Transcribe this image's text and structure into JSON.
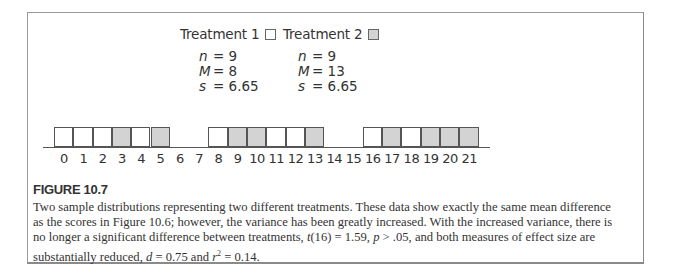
{
  "chart_data": {
    "type": "bar",
    "subtype": "frequency-distribution-blocks",
    "title": "FIGURE 10.7",
    "xlabel": "",
    "ylabel": "",
    "x_ticks": [
      0,
      1,
      2,
      3,
      4,
      5,
      6,
      7,
      8,
      9,
      10,
      11,
      12,
      13,
      14,
      15,
      16,
      17,
      18,
      19,
      20,
      21
    ],
    "xlim": [
      0,
      21
    ],
    "grid": false,
    "legend": [
      {
        "name": "Treatment 1",
        "fill": "#ffffff"
      },
      {
        "name": "Treatment 2",
        "fill": "#d3d3d3"
      }
    ],
    "series": [
      {
        "name": "Treatment 1",
        "fill": "#ffffff",
        "scores": [
          0,
          1,
          2,
          4,
          8,
          11,
          12,
          16,
          18
        ],
        "n": 9,
        "M": 8,
        "s": 6.65
      },
      {
        "name": "Treatment 2",
        "fill": "#d3d3d3",
        "scores": [
          3,
          5,
          9,
          10,
          13,
          17,
          19,
          20,
          21
        ],
        "n": 9,
        "M": 13,
        "s": 6.65
      }
    ]
  },
  "legend": {
    "t1": {
      "label": "Treatment 1",
      "stats": {
        "n": "= 9",
        "M": "= 8",
        "s": "= 6.65"
      }
    },
    "t2": {
      "label": "Treatment 2",
      "stats": {
        "n": "= 9",
        "M": "= 13",
        "s": "= 6.65"
      }
    },
    "sym_n": "n",
    "sym_M": "M",
    "sym_s": "s"
  },
  "figure": {
    "title": "FIGURE 10.7",
    "caption_parts": {
      "p1": "Two sample distributions representing two different treatments. These data show exactly the same mean difference as the scores in Figure 10.6; however, the variance has been greatly increased. With the increased variance, there is no longer a significant difference between treatments, ",
      "t": "t",
      "p2": "(16) = 1.59, ",
      "p": "p",
      "p3": " > .05, and both measures of effect size are substantially reduced, ",
      "d": "d",
      "p4": " = 0.75 and ",
      "r": "r",
      "sup": "2",
      "p5": " = 0.14."
    }
  },
  "colors": {
    "treatment1_fill": "#ffffff",
    "treatment2_fill": "#d3d3d3",
    "stroke": "#555555"
  }
}
